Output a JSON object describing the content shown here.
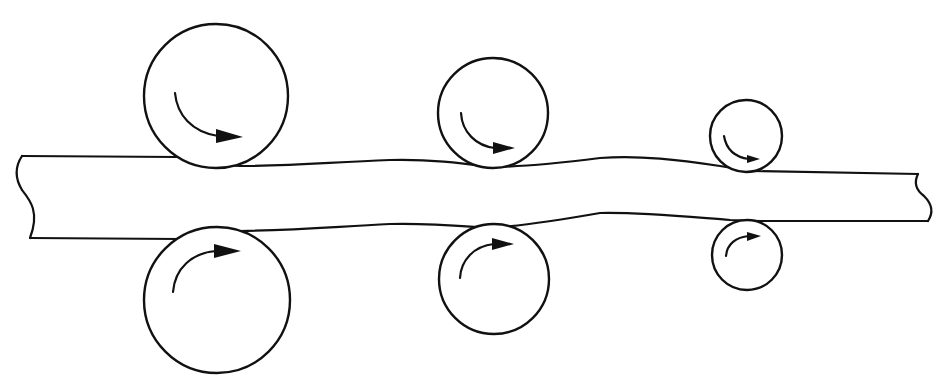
{
  "diagram": {
    "type": "rolling-mill-schematic",
    "colors": {
      "line": "#111111",
      "background": "#ffffff"
    },
    "strip": {
      "label": "",
      "left_end": "broken-edge",
      "right_end": "broken-edge"
    },
    "roll_pairs": [
      {
        "id": "stand-1",
        "size": "large",
        "top": {
          "cx": 216,
          "cy": 96,
          "r": 73,
          "rotation": "clockwise"
        },
        "bottom": {
          "cx": 217,
          "cy": 300,
          "r": 73,
          "rotation": "counter-clockwise"
        }
      },
      {
        "id": "stand-2",
        "size": "medium",
        "top": {
          "cx": 493,
          "cy": 114,
          "r": 55,
          "rotation": "clockwise"
        },
        "bottom": {
          "cx": 494,
          "cy": 279,
          "r": 55,
          "rotation": "counter-clockwise"
        }
      },
      {
        "id": "stand-3",
        "size": "small",
        "top": {
          "cx": 746,
          "cy": 137,
          "r": 36,
          "rotation": "clockwise"
        },
        "bottom": {
          "cx": 747,
          "cy": 256,
          "r": 36,
          "rotation": "counter-clockwise"
        }
      }
    ],
    "text_labels": []
  }
}
